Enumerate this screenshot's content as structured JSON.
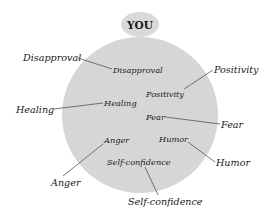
{
  "diagram": {
    "title": "YOU",
    "colors": {
      "circle_fill": "#d6d6d6",
      "you_fill": "#d9d9d9",
      "text": "#1a1a1a",
      "line": "#555555"
    },
    "labels": [
      {
        "id": "disapproval",
        "inner": "Disapproval",
        "outer": "Disapproval"
      },
      {
        "id": "positivity",
        "inner": "Positivity",
        "outer": "Positivity"
      },
      {
        "id": "healing",
        "inner": "Healing",
        "outer": "Healing"
      },
      {
        "id": "fear",
        "inner": "Fear",
        "outer": "Fear"
      },
      {
        "id": "anger",
        "inner": "Anger",
        "outer": "Anger"
      },
      {
        "id": "humor",
        "inner": "Humor",
        "outer": "Humor"
      },
      {
        "id": "self-confidence",
        "inner": "Self-confidence",
        "outer": "Self-confidence"
      }
    ]
  }
}
